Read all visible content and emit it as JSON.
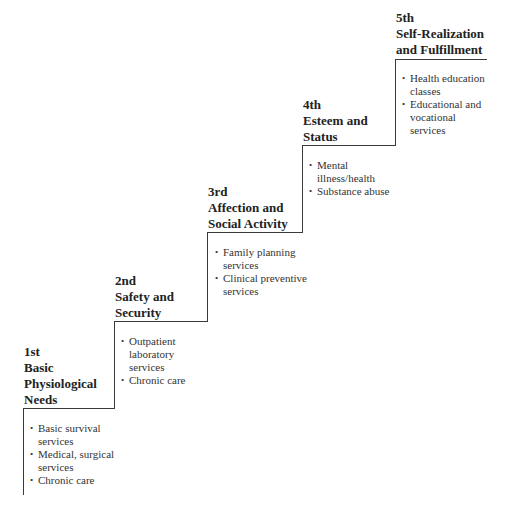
{
  "steps": [
    {
      "rank": "1st",
      "title_lines": [
        "Basic",
        "Physiological",
        "Needs"
      ],
      "items": [
        {
          "lines": [
            "Basic survival",
            "services"
          ]
        },
        {
          "lines": [
            "Medical, surgical",
            "services"
          ]
        },
        {
          "lines": [
            "Chronic care"
          ]
        }
      ]
    },
    {
      "rank": "2nd",
      "title_lines": [
        "Safety and",
        "Security"
      ],
      "items": [
        {
          "lines": [
            "Outpatient",
            "laboratory",
            "services"
          ]
        },
        {
          "lines": [
            "Chronic care"
          ]
        }
      ]
    },
    {
      "rank": "3rd",
      "title_lines": [
        "Affection and",
        "Social Activity"
      ],
      "items": [
        {
          "lines": [
            "Family planning",
            "services"
          ]
        },
        {
          "lines": [
            "Clinical preventive",
            "services"
          ]
        }
      ]
    },
    {
      "rank": "4th",
      "title_lines": [
        "Esteem and",
        "Status"
      ],
      "items": [
        {
          "lines": [
            "Mental",
            "illness/health"
          ]
        },
        {
          "lines": [
            "Substance abuse"
          ]
        }
      ]
    },
    {
      "rank": "5th",
      "title_lines": [
        "Self-Realization",
        "and Fulfillment"
      ],
      "items": [
        {
          "lines": [
            "Health education",
            "classes"
          ]
        },
        {
          "lines": [
            "Educational and",
            "vocational",
            "services"
          ]
        }
      ]
    }
  ]
}
